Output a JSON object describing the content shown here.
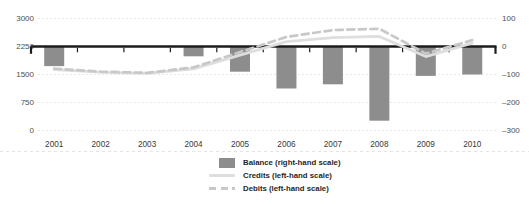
{
  "chart_data": {
    "type": "bar",
    "title": "",
    "categories": [
      "2001",
      "2002",
      "2003",
      "2004",
      "2005",
      "2006",
      "2007",
      "2008",
      "2009",
      "2010"
    ],
    "series": [
      {
        "name": "Balance (right-hand scale)",
        "type": "bar",
        "style": "solid",
        "axis": "right",
        "color": "#8d8d8d",
        "values": [
          -70,
          0,
          0,
          -35,
          -90,
          -150,
          -135,
          -265,
          -105,
          -100
        ]
      },
      {
        "name": "Credits (left-hand scale)",
        "type": "line",
        "style": "solid",
        "axis": "left",
        "color": "#dedede",
        "values": [
          1630,
          1560,
          1530,
          1650,
          2020,
          2380,
          2490,
          2520,
          1980,
          2340
        ]
      },
      {
        "name": "Debits (left-hand scale)",
        "type": "line",
        "style": "dashed",
        "axis": "left",
        "color": "#c8c8c8",
        "values": [
          1660,
          1575,
          1545,
          1690,
          2100,
          2505,
          2690,
          2725,
          2060,
          2420
        ]
      }
    ],
    "left_axis": {
      "range": [
        0,
        3000
      ],
      "tick_values": [
        3000,
        2250,
        1500,
        750,
        0
      ],
      "tick_labels": [
        "3000",
        "2250",
        "1500",
        "750",
        "0"
      ]
    },
    "right_axis": {
      "range": [
        -300,
        100
      ],
      "tick_values": [
        100,
        0,
        -100,
        -200,
        -300
      ],
      "tick_labels": [
        "100",
        "0",
        "–100",
        "–200",
        "–300"
      ]
    },
    "grid": "horizontal-dotted",
    "zero_line": "thick-black-at-left-2250-right-0",
    "legend_position": "bottom-center"
  },
  "legend": {
    "items": [
      {
        "label": "Balance (right-hand scale)",
        "swatch": "bar",
        "color": "#8d8d8d"
      },
      {
        "label": "Credits (left-hand scale)",
        "swatch": "solid-line",
        "color": "#dedede"
      },
      {
        "label": "Debits (left-hand scale)",
        "swatch": "dashed-line",
        "color": "#c8c8c8"
      }
    ]
  },
  "colors": {
    "axis": "#1c1c1c",
    "grid": "#e2e2e2",
    "bar": "#8d8d8d",
    "credits_line": "#dedede",
    "debits_line": "#c8c8c8",
    "tick_text": "#4d4d4d",
    "year_text": "#383838",
    "legend_text": "#1f1f1f"
  }
}
